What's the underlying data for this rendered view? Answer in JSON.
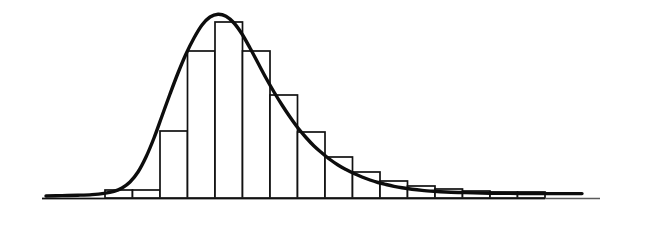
{
  "figure": {
    "background_color": "#ffffff",
    "line_color": "#111111",
    "curve_color": "#0d0d0d",
    "axis_color": "#5a5a5a",
    "width": 659,
    "height": 228
  },
  "chart_data": {
    "type": "bar",
    "title": "",
    "subtitle": "",
    "xlabel": "",
    "ylabel": "",
    "grid": false,
    "legend": null,
    "legend_position": "none",
    "annotations": [],
    "axis": {
      "baseline_y": 198,
      "x_start": 42,
      "x_end": 600,
      "x_tick_labels": [],
      "y_tick_labels": [],
      "xlim": [
        0,
        16
      ],
      "ylim": [
        0,
        1
      ]
    },
    "bin_width": 27.5,
    "bin_origin_x": 105,
    "categories": [
      "bin-1",
      "bin-2",
      "bin-3",
      "bin-4",
      "bin-5",
      "bin-6",
      "bin-7",
      "bin-8",
      "bin-9",
      "bin-10",
      "bin-11",
      "bin-12",
      "bin-13",
      "bin-14",
      "bin-15",
      "bin-16"
    ],
    "values": [
      0.045,
      0.045,
      0.381,
      0.835,
      1.0,
      0.835,
      0.585,
      0.375,
      0.233,
      0.148,
      0.097,
      0.068,
      0.051,
      0.04,
      0.034,
      0.034
    ],
    "bar_tops_px": [
      190,
      190,
      131,
      51,
      22,
      51,
      95,
      132,
      157,
      172,
      181,
      186,
      189,
      191,
      192,
      192
    ],
    "series": [
      {
        "name": "frequency",
        "values": [
          0.045,
          0.045,
          0.381,
          0.835,
          1.0,
          0.835,
          0.585,
          0.375,
          0.233,
          0.148,
          0.097,
          0.068,
          0.051,
          0.04,
          0.034,
          0.034
        ]
      }
    ],
    "density_curve": {
      "name": "fitted density",
      "peak_x_px": 216,
      "peak_y_px": 14,
      "points_px": [
        [
          46,
          196
        ],
        [
          62,
          195.6
        ],
        [
          78,
          195.2
        ],
        [
          92,
          194.6
        ],
        [
          104,
          193.4
        ],
        [
          114,
          191.4
        ],
        [
          122,
          188.0
        ],
        [
          130,
          182.0
        ],
        [
          138,
          172.0
        ],
        [
          146,
          157.0
        ],
        [
          154,
          138.0
        ],
        [
          162,
          116.0
        ],
        [
          170,
          94.0
        ],
        [
          178,
          73.0
        ],
        [
          186,
          54.0
        ],
        [
          194,
          38.0
        ],
        [
          202,
          25.0
        ],
        [
          210,
          17.0
        ],
        [
          218,
          14.2
        ],
        [
          226,
          16.2
        ],
        [
          234,
          23.0
        ],
        [
          242,
          34.0
        ],
        [
          250,
          48.0
        ],
        [
          258,
          63.0
        ],
        [
          266,
          78.0
        ],
        [
          274,
          92.0
        ],
        [
          282,
          105.0
        ],
        [
          290,
          117.0
        ],
        [
          298,
          128.0
        ],
        [
          306,
          137.5
        ],
        [
          314,
          146.0
        ],
        [
          322,
          153.0
        ],
        [
          330,
          159.5
        ],
        [
          338,
          165.0
        ],
        [
          346,
          169.5
        ],
        [
          354,
          173.5
        ],
        [
          362,
          177.0
        ],
        [
          370,
          180.0
        ],
        [
          378,
          182.5
        ],
        [
          386,
          184.5
        ],
        [
          394,
          186.3
        ],
        [
          402,
          187.8
        ],
        [
          412,
          189.3
        ],
        [
          422,
          190.4
        ],
        [
          434,
          191.3
        ],
        [
          446,
          192.0
        ],
        [
          460,
          192.5
        ],
        [
          474,
          192.9
        ],
        [
          490,
          193.2
        ],
        [
          508,
          193.4
        ],
        [
          528,
          193.5
        ],
        [
          548,
          193.6
        ],
        [
          568,
          193.6
        ],
        [
          582,
          193.6
        ]
      ]
    }
  }
}
